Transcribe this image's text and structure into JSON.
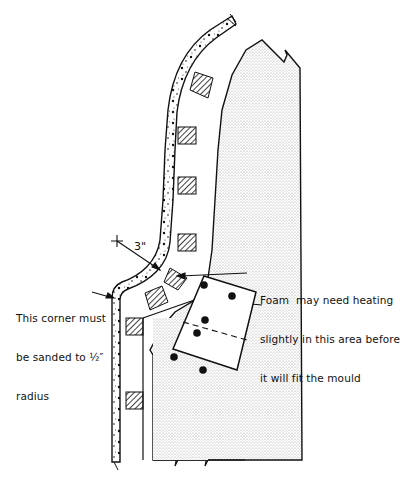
{
  "diagram": {
    "type": "technical cross-section drawing",
    "annotations": {
      "corner_note": {
        "lines": [
          "This corner must",
          "be sanded to ½″",
          "radius"
        ]
      },
      "foam_note": {
        "lines": [
          "Foam  may need heating",
          "slightly in this area before",
          "it will fit the mould"
        ]
      },
      "radius_dimension": "3\""
    },
    "components": [
      {
        "name": "foam-core-panel",
        "fill": "stippled"
      },
      {
        "name": "outer-skin-layer",
        "fill": "dotted-aggregate"
      },
      {
        "name": "spacer-blocks",
        "fill": "diagonal-hatch",
        "count": 7
      },
      {
        "name": "insert-plate",
        "bolts": 6,
        "dashed_centerline": true
      }
    ],
    "colors": {
      "ink": "#111111",
      "background": "#ffffff",
      "stipple": "#bdbdbd"
    }
  }
}
